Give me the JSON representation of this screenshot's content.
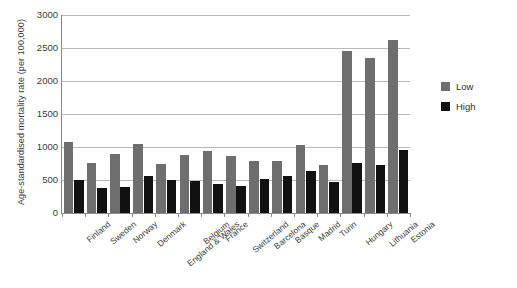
{
  "chart_data": {
    "type": "bar",
    "title": "",
    "xlabel": "",
    "ylabel": "Age-standardised mortality rate (per 100,000)",
    "ylim": [
      0,
      3000
    ],
    "ytick_labels": [
      "3000",
      "2500",
      "2000",
      "1500",
      "1000",
      "500",
      "0"
    ],
    "ytick_values": [
      3000,
      2500,
      2000,
      1500,
      1000,
      500,
      0
    ],
    "grid": true,
    "legend_position": "right",
    "categories": [
      "Finland",
      "Sweden",
      "Norway",
      "Denmark",
      "England & Wales",
      "Belgium",
      "France",
      "Switzerland",
      "Barcelona",
      "Basque",
      "Madrid",
      "Turin",
      "Hungary",
      "Lithuania",
      "Estonia"
    ],
    "series": [
      {
        "name": "Low",
        "color": "#6e6e6e",
        "values": [
          1080,
          760,
          890,
          1050,
          750,
          880,
          940,
          860,
          790,
          790,
          1030,
          730,
          2450,
          2350,
          2620
        ]
      },
      {
        "name": "High",
        "color": "#111111",
        "values": [
          500,
          380,
          390,
          560,
          500,
          490,
          440,
          410,
          520,
          560,
          630,
          470,
          760,
          720,
          960
        ]
      }
    ]
  },
  "legend": {
    "items": [
      {
        "label": "Low",
        "color": "#6e6e6e"
      },
      {
        "label": "High",
        "color": "#111111"
      }
    ]
  }
}
